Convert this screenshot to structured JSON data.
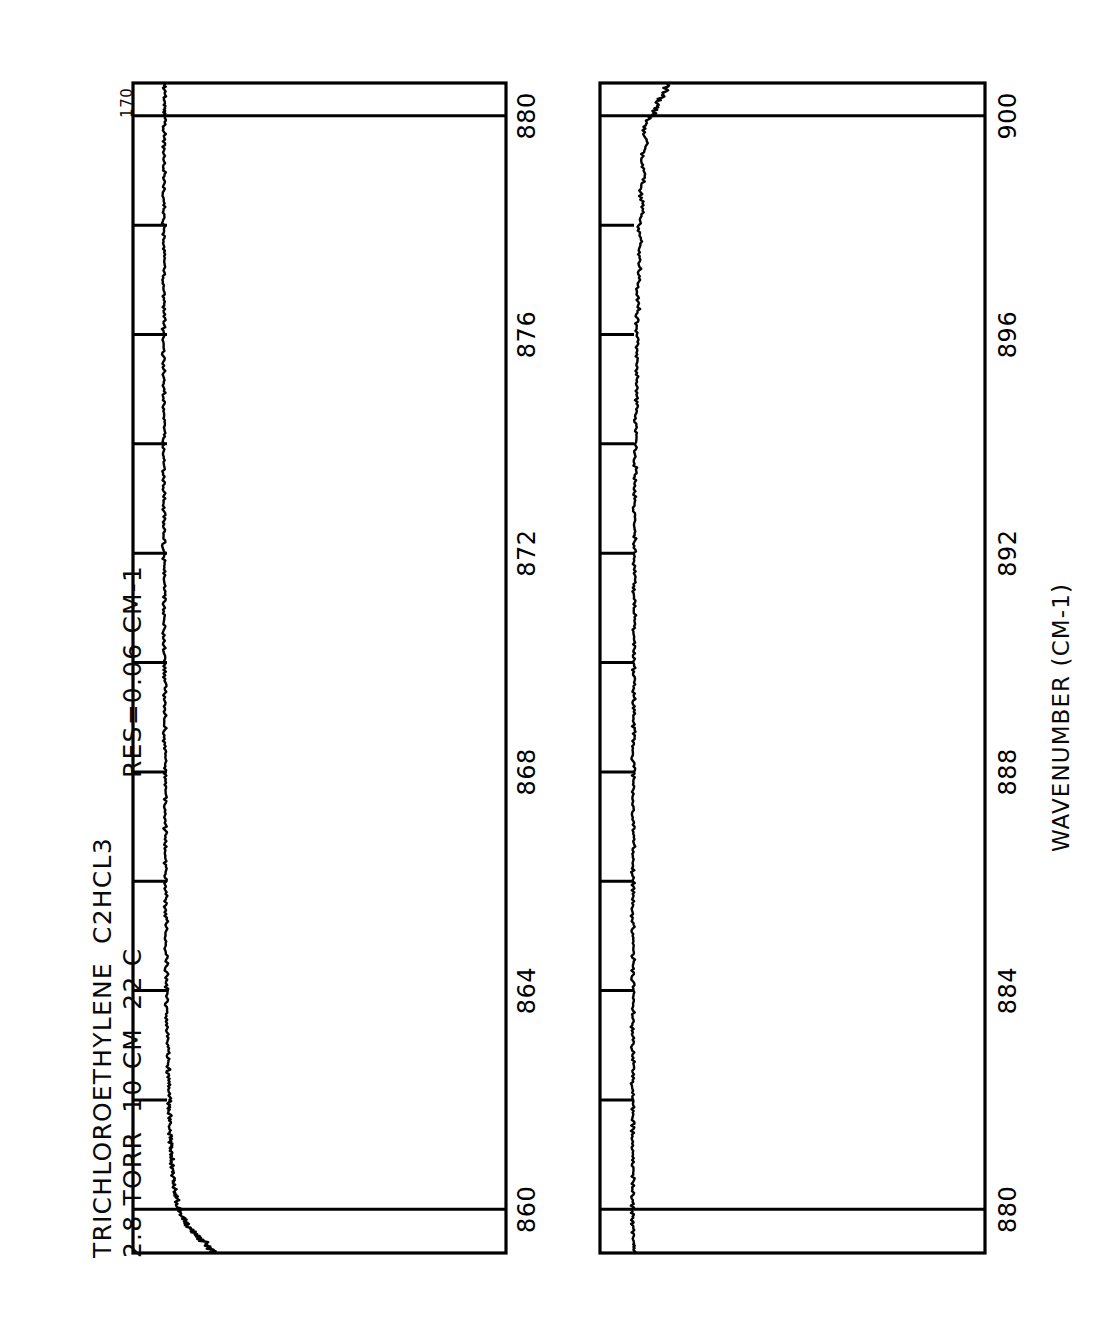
{
  "figure": {
    "background_color": "#ffffff",
    "ink_color": "#000000",
    "corner_label": "170",
    "title_lines": [
      "TRICHLOROETHYLENE  C2HCL3",
      "2.8 TORR  10 CM  22 C"
    ],
    "resolution_label": "RES=0.06 CM-1",
    "axis_title": "WAVENUMBER (CM-1)"
  },
  "chart_data": {
    "type": "line",
    "title": "TRICHLOROETHYLENE  C2HCL3",
    "subtitle": "2.8 TORR  10 CM  22 C",
    "annotations": [
      "RES=0.06 CM-1",
      "170"
    ],
    "orientation": "rotated-90-ccw",
    "xlabel": "WAVENUMBER (CM-1)",
    "ylabel": "TRANSMITTANCE",
    "grid": false,
    "legend": null,
    "panels": [
      {
        "name": "panel-top",
        "xlim": [
          859.2,
          880.6
        ],
        "major_ticks": [
          860,
          864,
          868,
          872,
          876,
          880
        ],
        "minor_tick_step": 2,
        "tick_labels": [
          "860",
          "864",
          "868",
          "872",
          "876",
          "880"
        ],
        "gridlines": [
          860,
          880
        ],
        "ylim": [
          0.0,
          1.0
        ],
        "series": [
          {
            "name": "transmittance",
            "x": [
              859.2,
              859.3,
              859.4,
              859.5,
              859.6,
              859.7,
              859.8,
              859.9,
              860.0,
              860.15,
              860.3,
              860.45,
              860.6,
              860.75,
              860.9,
              861.05,
              861.2,
              861.4,
              861.6,
              861.8,
              862.0,
              862.25,
              862.5,
              862.75,
              863.0,
              863.3,
              863.6,
              863.9,
              864.2,
              864.5,
              864.8,
              865.1,
              865.4,
              865.7,
              866.0,
              866.3,
              866.6,
              866.9,
              867.2,
              867.5,
              867.8,
              868.1,
              868.4,
              868.7,
              869.0,
              869.3,
              869.6,
              869.9,
              870.2,
              870.5,
              870.8,
              871.1,
              871.4,
              871.7,
              872.0,
              872.3,
              872.6,
              872.9,
              873.2,
              873.5,
              873.8,
              874.1,
              874.4,
              874.7,
              875.0,
              875.3,
              875.6,
              875.9,
              876.2,
              876.5,
              876.8,
              877.1,
              877.4,
              877.7,
              878.0,
              878.3,
              878.6,
              878.9,
              879.2,
              879.5,
              879.8,
              880.0,
              880.2,
              880.4,
              880.6
            ],
            "y": [
              0.215,
              0.205,
              0.19,
              0.175,
              0.16,
              0.148,
              0.138,
              0.13,
              0.124,
              0.118,
              0.113,
              0.11,
              0.108,
              0.106,
              0.104,
              0.103,
              0.101,
              0.1,
              0.099,
              0.098,
              0.097,
              0.096,
              0.095,
              0.094,
              0.093,
              0.092,
              0.091,
              0.091,
              0.09,
              0.09,
              0.089,
              0.089,
              0.088,
              0.088,
              0.088,
              0.087,
              0.087,
              0.087,
              0.086,
              0.086,
              0.086,
              0.086,
              0.085,
              0.085,
              0.085,
              0.085,
              0.085,
              0.084,
              0.084,
              0.084,
              0.084,
              0.084,
              0.084,
              0.084,
              0.083,
              0.083,
              0.083,
              0.083,
              0.083,
              0.083,
              0.083,
              0.083,
              0.083,
              0.083,
              0.083,
              0.083,
              0.083,
              0.083,
              0.083,
              0.083,
              0.083,
              0.083,
              0.083,
              0.083,
              0.083,
              0.083,
              0.083,
              0.083,
              0.083,
              0.083,
              0.083,
              0.084,
              0.084,
              0.084,
              0.084
            ]
          }
        ]
      },
      {
        "name": "panel-bottom",
        "xlim": [
          879.2,
          900.6
        ],
        "major_ticks": [
          880,
          884,
          888,
          892,
          896,
          900
        ],
        "minor_tick_step": 2,
        "tick_labels": [
          "880",
          "884",
          "888",
          "892",
          "896",
          "900"
        ],
        "gridlines": [
          880,
          900
        ],
        "ylim": [
          0.0,
          1.0
        ],
        "series": [
          {
            "name": "transmittance",
            "x": [
              879.2,
              879.4,
              879.6,
              879.8,
              880.0,
              880.3,
              880.6,
              880.9,
              881.2,
              881.5,
              881.8,
              882.1,
              882.4,
              882.7,
              883.0,
              883.3,
              883.6,
              883.9,
              884.2,
              884.5,
              884.8,
              885.1,
              885.4,
              885.7,
              886.0,
              886.3,
              886.6,
              886.9,
              887.2,
              887.5,
              887.8,
              888.1,
              888.4,
              888.7,
              889.0,
              889.3,
              889.6,
              889.9,
              890.2,
              890.5,
              890.8,
              891.1,
              891.4,
              891.7,
              892.0,
              892.3,
              892.6,
              892.9,
              893.2,
              893.5,
              893.8,
              894.1,
              894.4,
              894.7,
              895.0,
              895.3,
              895.6,
              895.9,
              896.2,
              896.5,
              896.8,
              897.1,
              897.4,
              897.7,
              898.0,
              898.3,
              898.6,
              898.9,
              899.2,
              899.5,
              899.8,
              900.0,
              900.2,
              900.4,
              900.6
            ],
            "y": [
              0.09,
              0.088,
              0.086,
              0.085,
              0.084,
              0.085,
              0.086,
              0.085,
              0.084,
              0.086,
              0.085,
              0.084,
              0.085,
              0.086,
              0.085,
              0.084,
              0.085,
              0.086,
              0.085,
              0.086,
              0.085,
              0.086,
              0.085,
              0.087,
              0.086,
              0.085,
              0.087,
              0.086,
              0.087,
              0.086,
              0.088,
              0.087,
              0.086,
              0.088,
              0.087,
              0.089,
              0.088,
              0.087,
              0.089,
              0.088,
              0.09,
              0.089,
              0.088,
              0.09,
              0.089,
              0.091,
              0.09,
              0.089,
              0.091,
              0.093,
              0.091,
              0.094,
              0.092,
              0.095,
              0.093,
              0.096,
              0.094,
              0.098,
              0.096,
              0.1,
              0.097,
              0.103,
              0.099,
              0.106,
              0.101,
              0.11,
              0.104,
              0.115,
              0.107,
              0.122,
              0.112,
              0.135,
              0.15,
              0.165,
              0.18
            ]
          }
        ]
      }
    ]
  }
}
